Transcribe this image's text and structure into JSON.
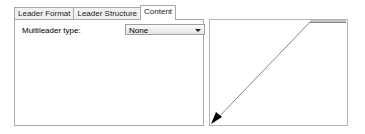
{
  "tabs": [
    {
      "label": "Leader Format",
      "active": false
    },
    {
      "label": "Leader Structure",
      "active": false
    },
    {
      "label": "Content",
      "active": true
    }
  ],
  "content": {
    "multileader_type_label": "Multileader type:",
    "multileader_type_value": "None"
  },
  "preview": {
    "description": "Leader line preview with arrowhead",
    "line_color": "#888888",
    "arrow_color": "#000000"
  }
}
